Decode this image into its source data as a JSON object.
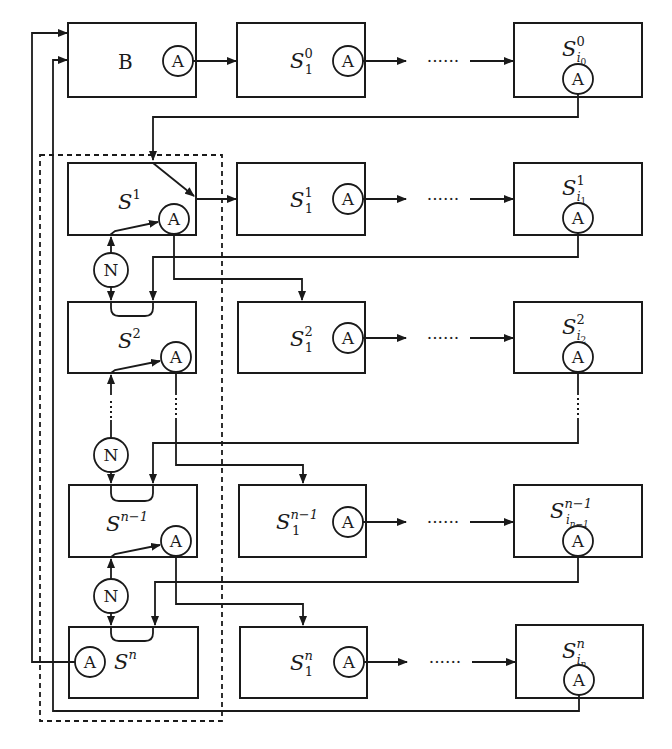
{
  "diagram": {
    "title": "",
    "node_labels": {
      "A": "A",
      "N": "N"
    },
    "ellipsis": "......",
    "rows": [
      {
        "main": {
          "base": "B",
          "sup": "",
          "kind": "plain"
        },
        "first": {
          "base": "S",
          "sup": "0",
          "sub": "1"
        },
        "last": {
          "base": "S",
          "sup": "0",
          "sub": "i",
          "subsub": "0"
        }
      },
      {
        "main": {
          "base": "S",
          "sup": "1"
        },
        "first": {
          "base": "S",
          "sup": "1",
          "sub": "1"
        },
        "last": {
          "base": "S",
          "sup": "1",
          "sub": "i",
          "subsub": "1"
        }
      },
      {
        "main": {
          "base": "S",
          "sup": "2"
        },
        "first": {
          "base": "S",
          "sup": "2",
          "sub": "1"
        },
        "last": {
          "base": "S",
          "sup": "2",
          "sub": "i",
          "subsub": "2"
        }
      },
      {
        "main": {
          "base": "S",
          "sup": "n−1"
        },
        "first": {
          "base": "S",
          "sup": "n−1",
          "sub": "1"
        },
        "last": {
          "base": "S",
          "sup": "n−1",
          "sub": "i",
          "subsub": "n−1"
        }
      },
      {
        "main": {
          "base": "S",
          "sup": "n"
        },
        "first": {
          "base": "S",
          "sup": "n",
          "sub": "1"
        },
        "last": {
          "base": "S",
          "sup": "n",
          "sub": "i",
          "subsub": "n"
        }
      }
    ]
  }
}
